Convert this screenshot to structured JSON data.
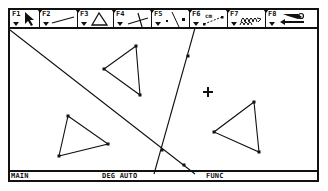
{
  "toolbar": {
    "tools": [
      {
        "key": "F1",
        "icon": "pointer-arrow-icon",
        "width": 30
      },
      {
        "key": "F2",
        "icon": "segment-icon",
        "width": 38
      },
      {
        "key": "F3",
        "icon": "triangle-icon",
        "width": 36
      },
      {
        "key": "F4",
        "icon": "perpendicular-lines-icon",
        "width": 38
      },
      {
        "key": "F5",
        "icon": "point-icon",
        "width": 38,
        "sub": ""
      },
      {
        "key": "F6",
        "icon": "measure-distance-icon",
        "width": 38,
        "sub": "cm"
      },
      {
        "key": "F7",
        "icon": "locus-animation-icon",
        "width": 38
      },
      {
        "key": "F8",
        "icon": "undo-arrow-icon",
        "width": 45
      }
    ]
  },
  "canvas": {
    "cursor_marker": {
      "x": 198,
      "y": 82,
      "icon": "crosshair-cursor-icon"
    },
    "lines": [
      {
        "name": "diagonal-line",
        "x1": 0,
        "y1": 20,
        "x2": 185,
        "y2": 164,
        "point": {
          "x": 174,
          "y": 155
        }
      },
      {
        "name": "steep-line",
        "x1": 185,
        "y1": 18,
        "x2": 144,
        "y2": 164,
        "point": {
          "x": 178,
          "y": 46
        }
      }
    ],
    "triangles": [
      {
        "name": "triangle-top",
        "points": [
          [
            126,
            36
          ],
          [
            94,
            59
          ],
          [
            130,
            85
          ]
        ]
      },
      {
        "name": "triangle-left",
        "points": [
          [
            58,
            106
          ],
          [
            98,
            134
          ],
          [
            49,
            146
          ]
        ]
      },
      {
        "name": "triangle-right",
        "points": [
          [
            244,
            92
          ],
          [
            204,
            122
          ],
          [
            249,
            142
          ]
        ]
      }
    ],
    "intersection": {
      "x": 152,
      "y": 140
    },
    "colors": {
      "ink": "#111111",
      "background": "#ffffff"
    }
  },
  "status_bar": {
    "mode": "MAIN",
    "angle_mode": "DEG AUTO",
    "graph_mode": "FUNC"
  }
}
